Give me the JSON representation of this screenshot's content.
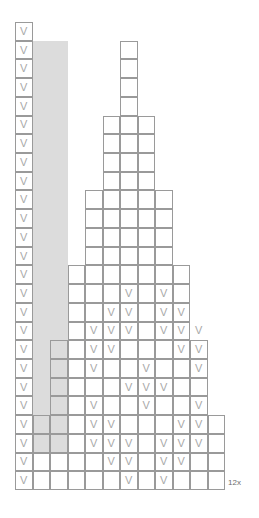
{
  "chart": {
    "type": "stitch-grid",
    "columns": 12,
    "rows": 25,
    "cell_width": 17.5,
    "cell_height": 18.72,
    "origin_x": 15,
    "origin_y": 22,
    "symbol": "V",
    "symbol_name": "v-stitch-symbol",
    "grid_line_color": "#9a9a9a",
    "highlight_color": "#dcdcdc",
    "symbol_color": "#a8a8a8",
    "background_color": "#ffffff",
    "repeat_label": "12x",
    "repeat_label_x": 228,
    "repeat_label_y": 479,
    "row_extents": [
      {
        "row": 1,
        "start": 1,
        "end": 1
      },
      {
        "row": 2,
        "start": 1,
        "end": 1
      },
      {
        "row": 3,
        "start": 1,
        "end": 1
      },
      {
        "row": 4,
        "start": 1,
        "end": 1
      },
      {
        "row": 5,
        "start": 1,
        "end": 1
      },
      {
        "row": 6,
        "start": 1,
        "end": 1
      },
      {
        "row": 7,
        "start": 1,
        "end": 1
      },
      {
        "row": 8,
        "start": 1,
        "end": 1
      },
      {
        "row": 9,
        "start": 1,
        "end": 1
      },
      {
        "row": 10,
        "start": 1,
        "end": 1
      },
      {
        "row": 11,
        "start": 1,
        "end": 1
      },
      {
        "row": 12,
        "start": 1,
        "end": 1
      },
      {
        "row": 13,
        "start": 1,
        "end": 1
      },
      {
        "row": 14,
        "start": 1,
        "end": 1
      },
      {
        "row": 15,
        "start": 1,
        "end": 1
      },
      {
        "row": 16,
        "start": 1,
        "end": 1
      },
      {
        "row": 17,
        "start": 1,
        "end": 1
      },
      {
        "row": 18,
        "start": 1,
        "end": 1
      },
      {
        "row": 19,
        "start": 1,
        "end": 1
      },
      {
        "row": 20,
        "start": 1,
        "end": 1
      },
      {
        "row": 21,
        "start": 1,
        "end": 1
      },
      {
        "row": 22,
        "start": 1,
        "end": 1
      },
      {
        "row": 23,
        "start": 1,
        "end": 1
      },
      {
        "row": 24,
        "start": 1,
        "end": 1
      },
      {
        "row": 25,
        "start": 1,
        "end": 1
      }
    ],
    "staircase": [
      {
        "row": 2,
        "start": 7,
        "end": 7
      },
      {
        "row": 3,
        "start": 7,
        "end": 7
      },
      {
        "row": 4,
        "start": 7,
        "end": 7
      },
      {
        "row": 5,
        "start": 7,
        "end": 7
      },
      {
        "row": 6,
        "start": 6,
        "end": 8
      },
      {
        "row": 7,
        "start": 6,
        "end": 8
      },
      {
        "row": 8,
        "start": 6,
        "end": 8
      },
      {
        "row": 9,
        "start": 6,
        "end": 8
      },
      {
        "row": 10,
        "start": 5,
        "end": 9
      },
      {
        "row": 11,
        "start": 5,
        "end": 9
      },
      {
        "row": 12,
        "start": 5,
        "end": 9
      },
      {
        "row": 13,
        "start": 5,
        "end": 9
      },
      {
        "row": 14,
        "start": 4,
        "end": 10
      },
      {
        "row": 15,
        "start": 4,
        "end": 10
      },
      {
        "row": 16,
        "start": 4,
        "end": 10
      },
      {
        "row": 17,
        "start": 4,
        "end": 10
      },
      {
        "row": 18,
        "start": 3,
        "end": 11
      },
      {
        "row": 19,
        "start": 3,
        "end": 11
      },
      {
        "row": 20,
        "start": 3,
        "end": 11
      },
      {
        "row": 21,
        "start": 3,
        "end": 11
      },
      {
        "row": 22,
        "start": 2,
        "end": 12
      },
      {
        "row": 23,
        "start": 2,
        "end": 12
      },
      {
        "row": 24,
        "start": 1,
        "end": 12
      },
      {
        "row": 25,
        "start": 1,
        "end": 12
      }
    ],
    "shaded_band": {
      "start_col": 2,
      "end_col": 3,
      "start_row": 2,
      "end_row": 23
    },
    "v_cells": [
      {
        "row": 1,
        "col": 1
      },
      {
        "row": 2,
        "col": 1
      },
      {
        "row": 3,
        "col": 1
      },
      {
        "row": 4,
        "col": 1
      },
      {
        "row": 5,
        "col": 1
      },
      {
        "row": 6,
        "col": 1
      },
      {
        "row": 7,
        "col": 1
      },
      {
        "row": 8,
        "col": 1
      },
      {
        "row": 9,
        "col": 1
      },
      {
        "row": 10,
        "col": 1
      },
      {
        "row": 11,
        "col": 1
      },
      {
        "row": 12,
        "col": 1
      },
      {
        "row": 13,
        "col": 1
      },
      {
        "row": 14,
        "col": 1
      },
      {
        "row": 15,
        "col": 1
      },
      {
        "row": 16,
        "col": 1
      },
      {
        "row": 17,
        "col": 1
      },
      {
        "row": 18,
        "col": 1
      },
      {
        "row": 19,
        "col": 1
      },
      {
        "row": 20,
        "col": 1
      },
      {
        "row": 21,
        "col": 1
      },
      {
        "row": 22,
        "col": 1
      },
      {
        "row": 23,
        "col": 1
      },
      {
        "row": 24,
        "col": 1
      },
      {
        "row": 25,
        "col": 1
      },
      {
        "row": 15,
        "col": 7
      },
      {
        "row": 15,
        "col": 9
      },
      {
        "row": 16,
        "col": 6
      },
      {
        "row": 16,
        "col": 7
      },
      {
        "row": 16,
        "col": 9
      },
      {
        "row": 16,
        "col": 10
      },
      {
        "row": 17,
        "col": 5
      },
      {
        "row": 17,
        "col": 6
      },
      {
        "row": 17,
        "col": 7
      },
      {
        "row": 17,
        "col": 9
      },
      {
        "row": 17,
        "col": 10
      },
      {
        "row": 17,
        "col": 11
      },
      {
        "row": 18,
        "col": 5
      },
      {
        "row": 18,
        "col": 6
      },
      {
        "row": 18,
        "col": 10
      },
      {
        "row": 18,
        "col": 11
      },
      {
        "row": 19,
        "col": 5
      },
      {
        "row": 19,
        "col": 8
      },
      {
        "row": 19,
        "col": 11
      },
      {
        "row": 20,
        "col": 7
      },
      {
        "row": 20,
        "col": 8
      },
      {
        "row": 20,
        "col": 9
      },
      {
        "row": 21,
        "col": 5
      },
      {
        "row": 21,
        "col": 8
      },
      {
        "row": 21,
        "col": 11
      },
      {
        "row": 22,
        "col": 5
      },
      {
        "row": 22,
        "col": 6
      },
      {
        "row": 22,
        "col": 10
      },
      {
        "row": 22,
        "col": 11
      },
      {
        "row": 23,
        "col": 5
      },
      {
        "row": 23,
        "col": 6
      },
      {
        "row": 23,
        "col": 7
      },
      {
        "row": 23,
        "col": 9
      },
      {
        "row": 23,
        "col": 10
      },
      {
        "row": 23,
        "col": 11
      },
      {
        "row": 24,
        "col": 6
      },
      {
        "row": 24,
        "col": 7
      },
      {
        "row": 24,
        "col": 9
      },
      {
        "row": 24,
        "col": 10
      },
      {
        "row": 25,
        "col": 7
      },
      {
        "row": 25,
        "col": 9
      }
    ]
  }
}
